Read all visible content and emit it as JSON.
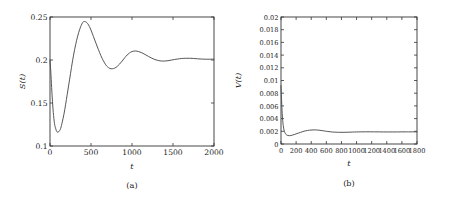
{
  "figure": {
    "background": "#ffffff",
    "curve_color": "#4d4d4d",
    "axis_color": "#333333"
  },
  "panels": [
    {
      "caption": "(a)",
      "xlabel": "t",
      "ylabel": "S(t)"
    },
    {
      "caption": "(b)",
      "xlabel": "t",
      "ylabel": "V(t)"
    }
  ],
  "chart_data": [
    {
      "type": "line",
      "title": "",
      "panel_label": "(a)",
      "xlabel": "t",
      "ylabel": "S(t)",
      "xlim": [
        0,
        2000
      ],
      "ylim": [
        0.1,
        0.25
      ],
      "xticks": [
        0,
        500,
        1000,
        1500,
        2000
      ],
      "xticklabels": [
        "0",
        "500",
        "1000",
        "1500",
        "2000"
      ],
      "yticks": [
        0.1,
        0.15,
        0.2,
        0.25
      ],
      "yticklabels": [
        "0.1",
        "0.15",
        "0.2",
        "0.25"
      ],
      "grid": false,
      "legend": null,
      "series": [
        {
          "name": "S(t)",
          "x": [
            0,
            10,
            20,
            30,
            40,
            55,
            70,
            85,
            100,
            115,
            130,
            150,
            170,
            190,
            210,
            230,
            250,
            275,
            300,
            325,
            350,
            375,
            400,
            420,
            440,
            460,
            480,
            500,
            530,
            560,
            590,
            620,
            650,
            680,
            700,
            730,
            760,
            790,
            820,
            850,
            880,
            910,
            940,
            970,
            1000,
            1040,
            1080,
            1120,
            1160,
            1200,
            1240,
            1280,
            1320,
            1360,
            1400,
            1440,
            1480,
            1520,
            1560,
            1600,
            1650,
            1700,
            1750,
            1800,
            1850,
            1900,
            1950,
            2000
          ],
          "y": [
            0.2,
            0.186,
            0.168,
            0.152,
            0.139,
            0.126,
            0.12,
            0.1165,
            0.1162,
            0.1175,
            0.1205,
            0.128,
            0.137,
            0.148,
            0.16,
            0.172,
            0.184,
            0.199,
            0.212,
            0.223,
            0.232,
            0.239,
            0.2438,
            0.2448,
            0.2442,
            0.2422,
            0.239,
            0.2348,
            0.2272,
            0.2196,
            0.2122,
            0.2052,
            0.1992,
            0.1944,
            0.1922,
            0.1902,
            0.1898,
            0.1906,
            0.1926,
            0.1954,
            0.1988,
            0.2025,
            0.2058,
            0.2082,
            0.2098,
            0.2105,
            0.2098,
            0.2084,
            0.2064,
            0.2042,
            0.2022,
            0.2005,
            0.1994,
            0.1988,
            0.1988,
            0.1992,
            0.1999,
            0.2006,
            0.2012,
            0.2017,
            0.202,
            0.202,
            0.2018,
            0.2014,
            0.2011,
            0.2009,
            0.2009,
            0.201
          ]
        }
      ]
    },
    {
      "type": "line",
      "title": "",
      "panel_label": "(b)",
      "xlabel": "t",
      "ylabel": "V(t)",
      "xlim": [
        0,
        1800
      ],
      "ylim": [
        0,
        0.02
      ],
      "xticks": [
        0,
        200,
        400,
        600,
        800,
        1000,
        1200,
        1400,
        1600,
        1800
      ],
      "xticklabels": [
        "0",
        "200",
        "400",
        "600",
        "800",
        "1000",
        "1200",
        "1400",
        "1600",
        "1800"
      ],
      "yticks": [
        0,
        0.002,
        0.004,
        0.006,
        0.008,
        0.01,
        0.012,
        0.014,
        0.016,
        0.018,
        0.02
      ],
      "yticklabels": [
        "0",
        "0.002",
        "0.004",
        "0.006",
        "0.008",
        "0.01",
        "0.012",
        "0.014",
        "0.016",
        "0.018",
        "0.02"
      ],
      "grid": false,
      "legend": null,
      "series": [
        {
          "name": "V(t)",
          "x": [
            0,
            8,
            16,
            25,
            35,
            45,
            60,
            75,
            90,
            110,
            130,
            150,
            175,
            200,
            230,
            260,
            290,
            320,
            350,
            380,
            410,
            440,
            470,
            500,
            530,
            560,
            590,
            620,
            650,
            680,
            710,
            740,
            780,
            820,
            860,
            900,
            950,
            1000,
            1060,
            1120,
            1180,
            1240,
            1300,
            1360,
            1420,
            1480,
            1540,
            1600,
            1660,
            1720,
            1800
          ],
          "y": [
            0.0092,
            0.0068,
            0.0048,
            0.0034,
            0.0025,
            0.002,
            0.0016,
            0.00142,
            0.00134,
            0.00131,
            0.00134,
            0.0014,
            0.00149,
            0.00159,
            0.00172,
            0.00184,
            0.00196,
            0.00206,
            0.00213,
            0.00218,
            0.00221,
            0.00222,
            0.00221,
            0.00218,
            0.00213,
            0.00208,
            0.00202,
            0.00197,
            0.00193,
            0.00189,
            0.00187,
            0.00185,
            0.00184,
            0.00184,
            0.00185,
            0.00186,
            0.00188,
            0.0019,
            0.00191,
            0.00192,
            0.00192,
            0.00191,
            0.00191,
            0.0019,
            0.0019,
            0.0019,
            0.0019,
            0.00191,
            0.00191,
            0.00191,
            0.00191
          ]
        }
      ]
    }
  ]
}
